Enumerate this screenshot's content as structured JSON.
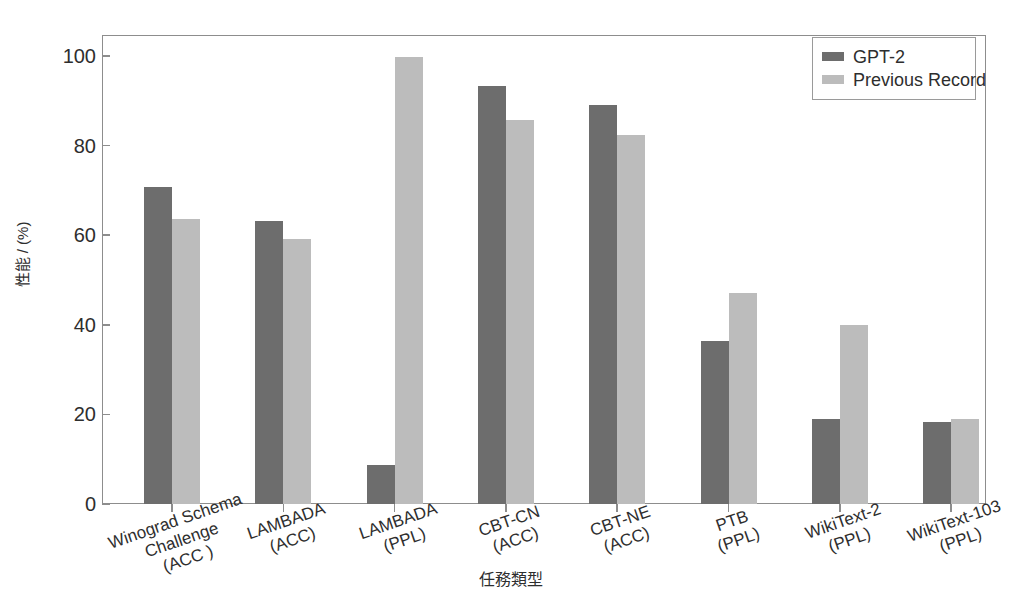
{
  "chart_data": {
    "type": "bar",
    "title": "",
    "xlabel": "任務類型",
    "ylabel": "性能 / (%)",
    "ylim": [
      0,
      100
    ],
    "yticks": [
      0,
      20,
      40,
      60,
      80,
      100
    ],
    "grid": false,
    "legend_position": "upper right",
    "categories": [
      "Winograd Schema\nChallenge\n(ACC )",
      "LAMBADA\n(ACC)",
      "LAMBADA\n(PPL)",
      "CBT-CN\n(ACC)",
      "CBT-NE\n(ACC)",
      "PTB\n(PPL)",
      "WikiText-2\n(PPL)",
      "WikiText-103\n(PPL)"
    ],
    "series": [
      {
        "name": "GPT-2",
        "color": "#6d6d6d",
        "values": [
          70.7,
          63.2,
          8.6,
          93.3,
          89.1,
          36.3,
          18.9,
          18.3
        ]
      },
      {
        "name": "Previous Record",
        "color": "#bcbcbc",
        "values": [
          63.7,
          59.2,
          99.8,
          85.7,
          82.3,
          47.0,
          39.9,
          18.9
        ]
      }
    ]
  },
  "axis_colors": {
    "frame": "#8d8d8d",
    "text": "#2e2e2e",
    "background": "#ffffff"
  }
}
